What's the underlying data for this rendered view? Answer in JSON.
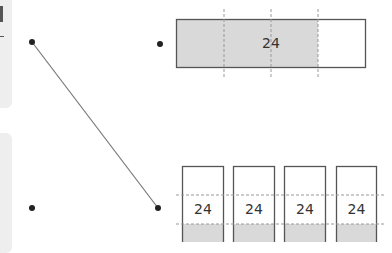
{
  "left_panels": [
    {
      "name": "top-panel"
    },
    {
      "name": "bottom-panel"
    }
  ],
  "top_bar": {
    "label": "24",
    "parts": 4,
    "shaded_parts": 3,
    "fill_color": "#d9d9d9"
  },
  "bottom_bars": {
    "count": 4,
    "labels": [
      "24",
      "24",
      "24",
      "24"
    ],
    "fill_color": "#d9d9d9"
  },
  "connector": {
    "from": "top-left-dot",
    "to": "bottom-right-dot"
  },
  "colors": {
    "stroke": "#555555",
    "dash": "#999999",
    "dot": "#222222",
    "panel": "#eeeeee"
  }
}
